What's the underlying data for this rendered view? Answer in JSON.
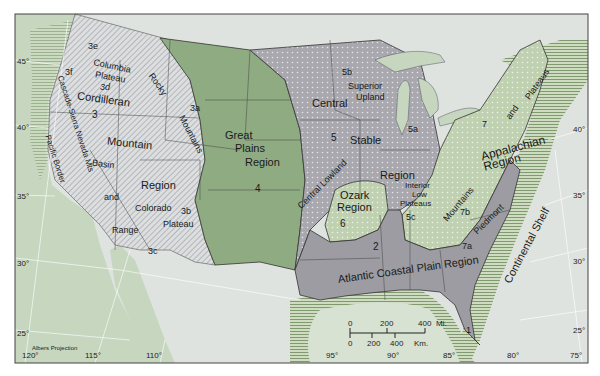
{
  "map": {
    "projection_label": "Albers Projection",
    "colors": {
      "ocean": "#dfe3df",
      "land_outside": "#c9d8c2",
      "cordilleran": "#d9dbdd",
      "great_plains": "#8fab82",
      "central_stable": "#a9a9ad",
      "appalachian": "#c5d5b8",
      "coastal_plain": "#9c9ca2",
      "continental_shelf": "#b9cfa8",
      "border": "#333333"
    },
    "regions": {
      "cordilleran": {
        "title_1": "Cordilleran",
        "title_num": "3",
        "title_2": "Mountain",
        "title_3": "Region",
        "sub_3e": "3e",
        "sub_3f": "3f",
        "columbia_1": "Columbia",
        "columbia_2": "Plateau",
        "sub_3d": "3d",
        "rocky": "Rocky",
        "sub_3a": "3a",
        "mountains": "Mountains",
        "cascade": "Cascade-Sierra Nevada Mts",
        "pacific_border": "Pacific Border",
        "basin": "Basin",
        "and": "and",
        "range": "Range",
        "colorado": "Colorado",
        "sub_3b": "3b",
        "plateau": "Plateau",
        "sub_3c": "3c"
      },
      "great_plains": {
        "line1": "Great",
        "line2": "Plains",
        "line3": "Region",
        "num": "4"
      },
      "central_stable": {
        "central": "Central",
        "stable": "Stable",
        "region": "Region",
        "num": "5",
        "sub_5a": "5a",
        "sub_5b": "5b",
        "superior_1": "Superior",
        "superior_2": "Upland",
        "central_lowland": "Central Lowland",
        "interior_1": "Interior",
        "interior_2": "Low",
        "interior_3": "Plateaus",
        "sub_5c": "5c"
      },
      "ozark": {
        "line1": "Ozark",
        "line2": "Region",
        "num": "6"
      },
      "appalachian": {
        "line1": "Appalachian",
        "line2": "Region",
        "num": "7",
        "and": "and",
        "plateaus": "Plateaus",
        "mountains": "Mountains",
        "piedmont": "Piedmont",
        "sub_7a": "7a",
        "sub_7b": "7b"
      },
      "coastal_plain": {
        "label": "Atlantic Coastal Plain Region",
        "num_2": "2",
        "num_1": "1"
      },
      "continental_shelf": {
        "label": "Continental Shelf"
      }
    },
    "latitudes": [
      "45°",
      "40°",
      "35°",
      "30°",
      "25°"
    ],
    "latitudes_right": [
      "40°",
      "35°",
      "30°",
      "25°"
    ],
    "longitudes": [
      "120°",
      "115°",
      "110°",
      "95°",
      "90°",
      "85°",
      "80°",
      "75°"
    ],
    "scale_bar": {
      "miles_ticks": [
        "0",
        "200",
        "400"
      ],
      "miles_unit": "Mi.",
      "km_ticks": [
        "0",
        "200",
        "400"
      ],
      "km_unit": "Km."
    }
  }
}
